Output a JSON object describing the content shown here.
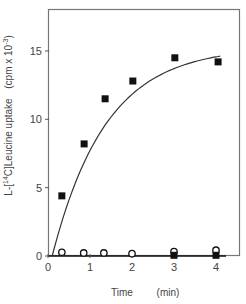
{
  "chart_data": {
    "type": "scatter",
    "title": "",
    "xlabel": "Time",
    "xunit": "(min)",
    "ylabel": "L-[14C]Leucine uptake",
    "yunit": "(cpm x 10 -3)",
    "xlim": [
      0,
      4.5
    ],
    "ylim": [
      0,
      18
    ],
    "xticks": [
      0,
      1,
      2,
      3,
      4
    ],
    "yticks": [
      0,
      5,
      10,
      15
    ],
    "grid": false,
    "legend": "none",
    "series": [
      {
        "name": "filled squares",
        "marker": "square-filled",
        "x": [
          0.33,
          0.86,
          1.36,
          2.02,
          3.02,
          4.05
        ],
        "y": [
          4.4,
          8.2,
          11.5,
          12.8,
          14.5,
          14.2
        ]
      },
      {
        "name": "open circles",
        "marker": "circle-open",
        "x": [
          0.33,
          0.85,
          1.33,
          2.0,
          3.0,
          4.0
        ],
        "y": [
          0.2,
          0.15,
          0.15,
          0.1,
          0.25,
          0.35
        ]
      },
      {
        "name": "filled squares (baseline)",
        "marker": "square-filled",
        "x": [
          3.0,
          4.0
        ],
        "y": [
          0.05,
          0.05
        ]
      },
      {
        "name": "fit curve",
        "marker": "line",
        "model": "saturation",
        "x": [
          0.1,
          0.3,
          0.5,
          0.75,
          1.0,
          1.5,
          2.0,
          2.5,
          3.0,
          3.5,
          4.1
        ],
        "y": [
          0.0,
          3.9,
          5.6,
          7.3,
          8.7,
          10.9,
          12.3,
          13.3,
          14.0,
          14.4,
          14.7
        ]
      }
    ]
  },
  "axes": {
    "x_label": "Time",
    "x_unit": "(min)",
    "y_label_main": "L-[14C]Leucine uptake",
    "y_label_prefix": "L-[",
    "y_label_sup": "14",
    "y_label_suffix": "C]Leucine uptake",
    "y_unit_main": "(cpm x 10",
    "y_unit_sup": "-3",
    "y_unit_close": ")",
    "x_tick_labels": [
      "0",
      "1",
      "2",
      "3",
      "4"
    ],
    "y_tick_labels": [
      "0",
      "5",
      "10",
      "15"
    ]
  },
  "colors": {
    "axis": "#555555",
    "marker": "#111111",
    "curve": "#333333",
    "text": "#444444"
  }
}
